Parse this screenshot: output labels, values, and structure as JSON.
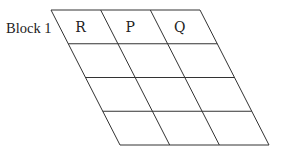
{
  "diagram": {
    "block_label": "Block 1",
    "rows": 4,
    "columns": 3,
    "column_headers": [
      "R",
      "P",
      "Q"
    ],
    "cells": [
      [
        "R",
        "P",
        "Q"
      ],
      [
        "",
        "",
        ""
      ],
      [
        "",
        "",
        ""
      ],
      [
        "",
        "",
        ""
      ]
    ]
  }
}
